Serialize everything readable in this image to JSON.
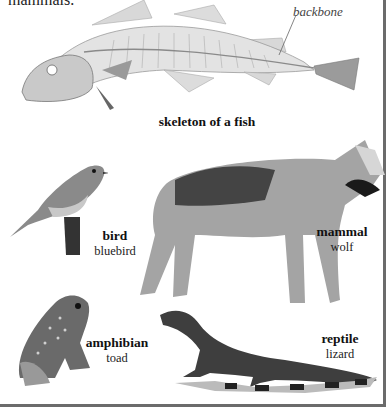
{
  "intro_text_fragment": "mammals.",
  "fish": {
    "label": "skeleton of a fish",
    "callout": "backbone"
  },
  "animals": [
    {
      "group": "bird",
      "example": "bluebird"
    },
    {
      "group": "mammal",
      "example": "wolf"
    },
    {
      "group": "amphibian",
      "example": "toad"
    },
    {
      "group": "reptile",
      "example": "lizard"
    }
  ],
  "colors": {
    "frame_border": "#6b6b6b",
    "background": "#ffffff",
    "text": "#111111"
  }
}
